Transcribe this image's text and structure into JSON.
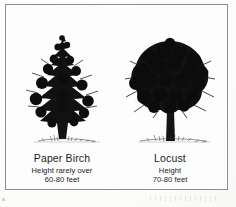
{
  "figure": {
    "frame_color": "#8d8d8d",
    "background_color": "#fdfdfd",
    "ink_color": "#101010"
  },
  "trees": [
    {
      "name": "Paper Birch",
      "shape": "tall narrow pyramidal crown with slender pale central trunk",
      "height_note_line1": "Height rarely over",
      "height_note_line2": "60-80 feet",
      "height_min_feet": 60,
      "height_max_feet": 80
    },
    {
      "name": "Locust",
      "shape": "broad rounded oval crown on a short stout trunk",
      "height_note_line1": "Height",
      "height_note_line2": "70-80 feet",
      "height_min_feet": 70,
      "height_max_feet": 80
    }
  ]
}
